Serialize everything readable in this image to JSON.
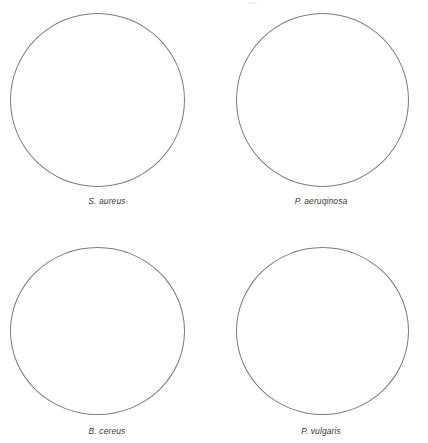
{
  "figure": {
    "background_color": "#ffffff",
    "outline_color": "#7c7c7c",
    "label_color": "#3a3a3a",
    "panels": [
      {
        "id": "panel-s-aureus",
        "label": "S. aureus",
        "row": 0,
        "col": 0
      },
      {
        "id": "panel-p-aeruqinosa",
        "label": "P. aeruqinosa",
        "row": 0,
        "col": 1
      },
      {
        "id": "panel-b-cereus",
        "label": "B. cereus",
        "row": 1,
        "col": 0
      },
      {
        "id": "panel-p-vulgaris",
        "label": "P. vulgaris",
        "row": 1,
        "col": 1
      }
    ]
  },
  "chart_data": {
    "type": "diagram",
    "title": "",
    "subtitle": "",
    "layout": "2x2 grid of circular culture-plate outlines",
    "categories": [
      "S. aureus",
      "P. aeruqinosa",
      "B. cereus",
      "P. vulgaris"
    ],
    "values": [
      0,
      0,
      0,
      0
    ],
    "annotations": [],
    "legend": [],
    "grid": false
  }
}
